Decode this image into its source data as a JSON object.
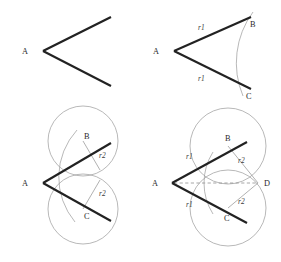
{
  "figure": {
    "background_color": "#ffffff",
    "ray_color": "#222222",
    "arc_color": "#9a9a9a",
    "bisector_color": "#8f8f8f",
    "label_color": "#2a2a2a"
  },
  "panels": [
    {
      "id": "step-1",
      "name": "given-angle",
      "labels": {
        "vertex": "A"
      }
    },
    {
      "id": "step-2",
      "name": "arc-from-vertex",
      "labels": {
        "vertex": "A",
        "upper_point": "B",
        "lower_point": "C",
        "upper_radius": "r1",
        "lower_radius": "r1"
      }
    },
    {
      "id": "step-3",
      "name": "circles-from-b-and-c",
      "labels": {
        "vertex": "A",
        "upper_point": "B",
        "lower_point": "C",
        "upper_radius": "r2",
        "lower_radius": "r2"
      }
    },
    {
      "id": "step-4",
      "name": "bisector-through-intersection",
      "labels": {
        "vertex": "A",
        "upper_point": "B",
        "lower_point": "C",
        "intersection_point": "D",
        "upper_arm_radius": "r1",
        "lower_arm_radius": "r1",
        "upper_circle_radius": "r2",
        "lower_circle_radius": "r2"
      }
    }
  ],
  "geometry": {
    "panel1": {
      "vertex": [
        43,
        51
      ],
      "upper_end": [
        111,
        17
      ],
      "lower_end": [
        111,
        86
      ]
    },
    "panel2": {
      "vertex": [
        174,
        51
      ],
      "upper_end": [
        251,
        17
      ],
      "lower_end": [
        251,
        89
      ],
      "arc_radius": 86,
      "point_b": [
        246,
        24
      ],
      "point_c": [
        243,
        90
      ]
    },
    "panel3": {
      "vertex": [
        43,
        183
      ],
      "upper_end": [
        111,
        143
      ],
      "lower_end": [
        111,
        221
      ],
      "point_b": [
        83,
        141
      ],
      "point_c": [
        83,
        209
      ],
      "circle_radius": 35
    },
    "panel4": {
      "vertex": [
        172,
        183
      ],
      "upper_end": [
        247,
        142
      ],
      "lower_end": [
        247,
        223
      ],
      "point_b": [
        228,
        146
      ],
      "point_c": [
        228,
        208
      ],
      "point_d": [
        258,
        183
      ],
      "circle_radius": 38
    }
  }
}
